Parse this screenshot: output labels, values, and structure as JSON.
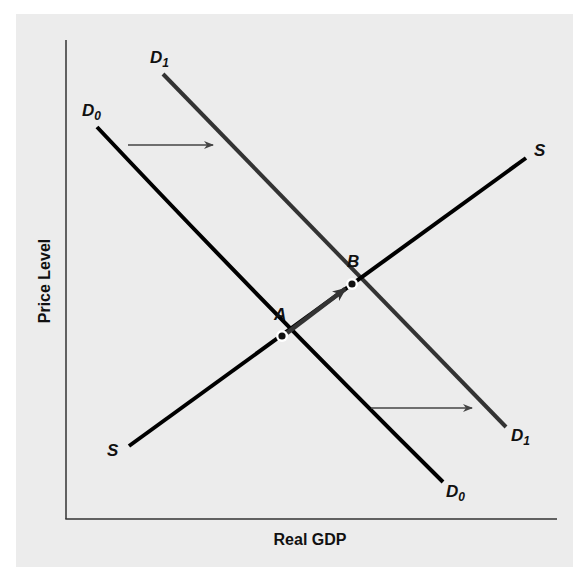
{
  "diagram": {
    "type": "aggregate-demand-supply-shift",
    "axes": {
      "x_label": "Real GDP",
      "y_label": "Price Level"
    },
    "curves": {
      "d0": {
        "label": "D",
        "subscript": "0",
        "color": "#000000"
      },
      "d1": {
        "label": "D",
        "subscript": "1",
        "color": "#333333"
      },
      "s": {
        "label_start": "S",
        "label_end": "S",
        "color": "#000000"
      }
    },
    "points": {
      "a": {
        "label": "A"
      },
      "b": {
        "label": "B"
      }
    },
    "annotations": {
      "shift_arrows": "rightward shift of demand from D0 to D1",
      "movement_arrow": "movement along S from A to B"
    },
    "colors": {
      "panel_bg": "#ececec",
      "axis": "#333333",
      "arrow": "#444444"
    }
  }
}
